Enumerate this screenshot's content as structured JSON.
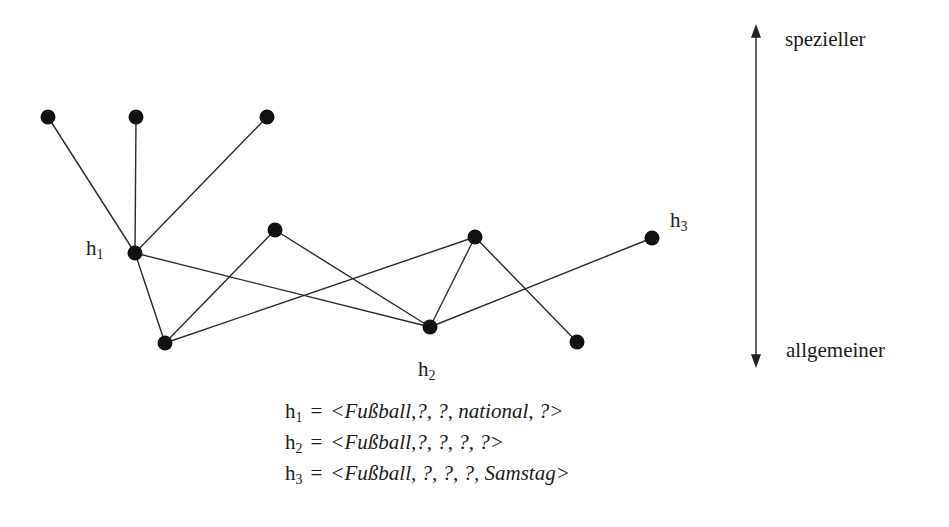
{
  "diagram": {
    "title": "",
    "nodes": [
      {
        "id": "n1",
        "x": 48,
        "y": 117
      },
      {
        "id": "n2",
        "x": 136,
        "y": 117
      },
      {
        "id": "n3",
        "x": 267,
        "y": 117
      },
      {
        "id": "h1",
        "x": 135,
        "y": 253,
        "label": "h",
        "label_sub": "1"
      },
      {
        "id": "n5",
        "x": 275,
        "y": 230
      },
      {
        "id": "n6",
        "x": 475,
        "y": 237
      },
      {
        "id": "h3",
        "x": 652,
        "y": 238,
        "label": "h",
        "label_sub": "3"
      },
      {
        "id": "n8",
        "x": 165,
        "y": 343
      },
      {
        "id": "h2",
        "x": 430,
        "y": 327,
        "label": "h",
        "label_sub": "2"
      },
      {
        "id": "n10",
        "x": 577,
        "y": 342
      }
    ],
    "edges": [
      [
        "n1",
        "h1"
      ],
      [
        "n2",
        "h1"
      ],
      [
        "n3",
        "h1"
      ],
      [
        "h1",
        "n8"
      ],
      [
        "h1",
        "h2"
      ],
      [
        "n8",
        "n5"
      ],
      [
        "n8",
        "n6"
      ],
      [
        "n5",
        "h2"
      ],
      [
        "n6",
        "h2"
      ],
      [
        "n6",
        "n10"
      ],
      [
        "h2",
        "h3"
      ]
    ],
    "node_labels": {
      "h1": {
        "base": "h",
        "sub": "1"
      },
      "h2": {
        "base": "h",
        "sub": "2"
      },
      "h3": {
        "base": "h",
        "sub": "3"
      }
    },
    "axis": {
      "top_label": "spezieller",
      "bottom_label": "allgemeiner"
    },
    "formulas": [
      {
        "base": "h",
        "sub": "1",
        "eq": "=",
        "tuple": "<Fußball,?, ?, national, ?>"
      },
      {
        "base": "h",
        "sub": "2",
        "eq": "=",
        "tuple": "<Fußball,?, ?, ?, ?>"
      },
      {
        "base": "h",
        "sub": "3",
        "eq": "=",
        "tuple": "<Fußball, ?, ?, ?, Samstag>"
      }
    ],
    "colors": {
      "line": "#2a2a2a",
      "node": "#111111",
      "background": "#ffffff"
    }
  }
}
